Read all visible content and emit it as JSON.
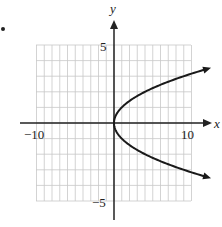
{
  "chart_data": {
    "type": "line",
    "title": "",
    "equation_hint": "x = y^2",
    "xlabel": "x",
    "ylabel": "y",
    "xlim": [
      -10,
      10
    ],
    "ylim": [
      -5,
      5
    ],
    "x_tick_labels": [
      "-10",
      "10"
    ],
    "y_tick_labels": [
      "5",
      "-5"
    ],
    "grid": true,
    "series": [
      {
        "name": "curve",
        "points": [
          {
            "x": 12.0,
            "y": 3.46
          },
          {
            "x": 9,
            "y": 3
          },
          {
            "x": 4,
            "y": 2
          },
          {
            "x": 1,
            "y": 1
          },
          {
            "x": 0.25,
            "y": 0.5
          },
          {
            "x": 0,
            "y": 0
          },
          {
            "x": 0.25,
            "y": -0.5
          },
          {
            "x": 1,
            "y": -1
          },
          {
            "x": 4,
            "y": -2
          },
          {
            "x": 9,
            "y": -3
          },
          {
            "x": 12.0,
            "y": -3.46
          }
        ],
        "arrows_at_ends": true
      }
    ]
  },
  "labels": {
    "y_axis": "y",
    "x_axis": "x",
    "y_top": "5",
    "y_bottom": "−5",
    "x_left": "−10",
    "x_right": "10"
  },
  "colors": {
    "grid": "#c8c8c8",
    "axis": "#222222",
    "curve": "#1a1a1a"
  }
}
